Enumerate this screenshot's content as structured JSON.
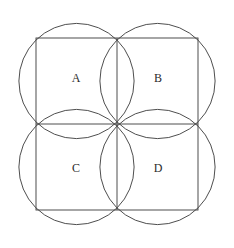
{
  "figure": {
    "canvas": {
      "width": 234,
      "height": 248,
      "background": "#ffffff"
    },
    "stroke": {
      "color": "#3a3a3a",
      "width": 0.9
    },
    "text_color": "#2b2b2b"
  },
  "square": {
    "name": "outer-square",
    "left": 36,
    "top": 38,
    "right": 198,
    "bottom": 210,
    "width": 162,
    "height": 172
  },
  "midlines": {
    "vertical_x": 117,
    "horizontal_y": 124
  },
  "quadrants": [
    {
      "id": "A",
      "label": "A",
      "position": "top-left",
      "label_x": 76,
      "label_y": 79,
      "cx": 76.5,
      "cy": 81,
      "r": 57.6
    },
    {
      "id": "B",
      "label": "B",
      "position": "top-right",
      "label_x": 158,
      "label_y": 79,
      "cx": 157.5,
      "cy": 81,
      "r": 57.6
    },
    {
      "id": "C",
      "label": "C",
      "position": "bottom-left",
      "label_x": 76,
      "label_y": 169,
      "cx": 76.5,
      "cy": 167,
      "r": 57.6
    },
    {
      "id": "D",
      "label": "D",
      "position": "bottom-right",
      "label_x": 158,
      "label_y": 169,
      "cx": 157.5,
      "cy": 167,
      "r": 57.6
    }
  ]
}
